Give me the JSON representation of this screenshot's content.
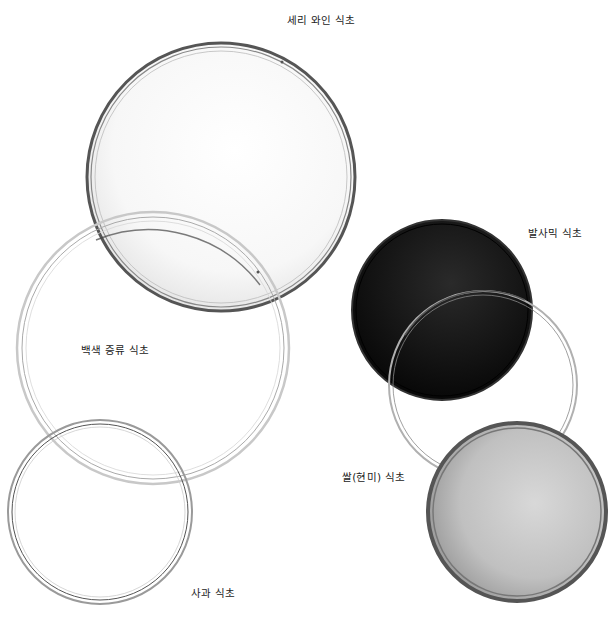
{
  "labels": {
    "sherry": "세리 와인 식초",
    "balsamic": "발사믹 식초",
    "white_distilled": "백색 증류 식초",
    "rice": "쌀(현미) 식초",
    "apple": "사과 식초"
  },
  "dishes": [
    {
      "id": "sherry",
      "cx": 221,
      "cy": 177,
      "r": 134,
      "fill": "#f4f4f4",
      "rim": "#3a3a3a"
    },
    {
      "id": "white_distilled",
      "cx": 153,
      "cy": 348,
      "r": 136,
      "fill": "none",
      "rim": "#9a9a9a"
    },
    {
      "id": "apple",
      "cx": 100,
      "cy": 512,
      "r": 92,
      "fill": "none",
      "rim": "#6a6a6a"
    },
    {
      "id": "balsamic",
      "cx": 442,
      "cy": 310,
      "r": 90,
      "fill": "#111111",
      "rim": "#222222"
    },
    {
      "id": "rice",
      "cx": 483,
      "cy": 385,
      "r": 94,
      "fill": "none",
      "rim": "#8a8a8a"
    },
    {
      "id": "brown_rice",
      "cx": 517,
      "cy": 512,
      "r": 89,
      "fill": "#b8b8b8",
      "rim": "#4a4a4a"
    }
  ]
}
